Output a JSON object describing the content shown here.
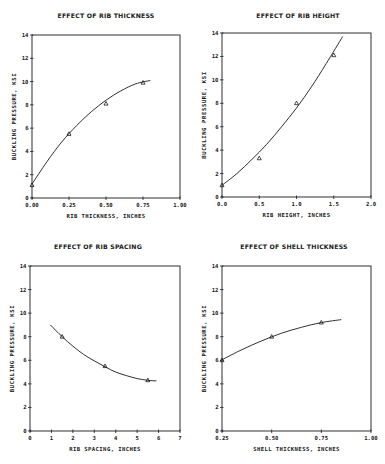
{
  "chart_data": [
    {
      "type": "line",
      "title": "EFFECT OF RIB THICKNESS",
      "xlabel": "RIB THICKNESS, INCHES",
      "ylabel": "BUCKLING PRESSURE, KSI",
      "xlim": [
        0,
        1.0
      ],
      "ylim": [
        0,
        14
      ],
      "xticks": [
        0,
        0.25,
        0.5,
        0.75,
        1.0
      ],
      "xtick_labels": [
        "0.00",
        "0.25",
        "0.50",
        "0.75",
        "1.00"
      ],
      "yticks": [
        0,
        2,
        4,
        6,
        8,
        10,
        12,
        14
      ],
      "ytick_labels": [
        "0",
        "2",
        "4",
        "6",
        "8",
        "10",
        "12",
        "14"
      ],
      "grid": false,
      "marker": "triangle",
      "points": {
        "x": [
          0.0,
          0.25,
          0.5,
          0.75
        ],
        "y": [
          1.1,
          5.5,
          8.1,
          9.9
        ]
      },
      "curve": {
        "x": [
          0.0,
          0.1,
          0.2,
          0.3,
          0.4,
          0.5,
          0.6,
          0.7,
          0.8
        ],
        "y": [
          1.2,
          3.1,
          4.8,
          6.2,
          7.4,
          8.4,
          9.2,
          9.8,
          10.1
        ]
      }
    },
    {
      "type": "line",
      "title": "EFFECT OF RIB HEIGHT",
      "xlabel": "RIB HEIGHT, INCHES",
      "ylabel": "BUCKLING PRESSURE, KSI",
      "xlim": [
        0,
        2.0
      ],
      "ylim": [
        0,
        14
      ],
      "xticks": [
        0,
        0.5,
        1.0,
        1.5,
        2.0
      ],
      "xtick_labels": [
        "0.0",
        "0.5",
        "1.0",
        "1.5",
        "2.0"
      ],
      "yticks": [
        0,
        2,
        4,
        6,
        8,
        10,
        12,
        14
      ],
      "ytick_labels": [
        "0",
        "2",
        "4",
        "6",
        "8",
        "10",
        "12",
        "14"
      ],
      "grid": false,
      "marker": "triangle",
      "points": {
        "x": [
          0.0,
          0.5,
          1.0,
          1.5
        ],
        "y": [
          1.0,
          3.3,
          8.0,
          12.1
        ]
      },
      "curve": {
        "x": [
          0.0,
          0.2,
          0.4,
          0.6,
          0.8,
          1.0,
          1.2,
          1.4,
          1.62
        ],
        "y": [
          1.0,
          2.0,
          3.2,
          4.5,
          6.0,
          7.6,
          9.4,
          11.4,
          13.7
        ]
      }
    },
    {
      "type": "line",
      "title": "EFFECT OF RIB SPACING",
      "xlabel": "RIB SPACING, INCHES",
      "ylabel": "BUCKLING PRESSURE, KSI",
      "xlim": [
        0,
        7
      ],
      "ylim": [
        0,
        14
      ],
      "xticks": [
        0,
        1,
        2,
        3,
        4,
        5,
        6,
        7
      ],
      "xtick_labels": [
        "0",
        "1",
        "2",
        "3",
        "4",
        "5",
        "6",
        "7"
      ],
      "yticks": [
        0,
        2,
        4,
        6,
        8,
        10,
        12,
        14
      ],
      "ytick_labels": [
        "0",
        "2",
        "4",
        "6",
        "8",
        "10",
        "12",
        "14"
      ],
      "grid": false,
      "marker": "triangle",
      "points": {
        "x": [
          1.5,
          3.5,
          5.5
        ],
        "y": [
          8.0,
          5.5,
          4.3
        ]
      },
      "curve": {
        "x": [
          0.95,
          1.5,
          2.0,
          2.5,
          3.0,
          3.5,
          4.0,
          4.5,
          5.0,
          5.5,
          5.9
        ],
        "y": [
          9.0,
          8.0,
          7.2,
          6.5,
          5.95,
          5.45,
          5.0,
          4.7,
          4.45,
          4.3,
          4.25
        ]
      }
    },
    {
      "type": "line",
      "title": "EFFECT OF SHELL THICKNESS",
      "xlabel": "SHELL THICKNESS, INCHES",
      "ylabel": "BUCKLING PRESSURE, KSI",
      "xlim": [
        0.25,
        1.0
      ],
      "ylim": [
        0,
        14
      ],
      "xticks": [
        0.25,
        0.5,
        0.75,
        1.0
      ],
      "xtick_labels": [
        "0.25",
        "0.50",
        "0.75",
        "1.00"
      ],
      "yticks": [
        0,
        2,
        4,
        6,
        8,
        10,
        12,
        14
      ],
      "ytick_labels": [
        "0",
        "2",
        "4",
        "6",
        "8",
        "10",
        "12",
        "14"
      ],
      "grid": false,
      "marker": "triangle",
      "points": {
        "x": [
          0.25,
          0.5,
          0.75
        ],
        "y": [
          6.0,
          8.0,
          9.2
        ]
      },
      "curve": {
        "x": [
          0.25,
          0.35,
          0.45,
          0.55,
          0.65,
          0.75,
          0.85
        ],
        "y": [
          6.05,
          6.9,
          7.65,
          8.3,
          8.8,
          9.2,
          9.45
        ]
      }
    }
  ],
  "layout": [
    {
      "left": 32,
      "top": 35,
      "right": 180,
      "bottom": 198,
      "title_x": 106,
      "title_y": 18
    },
    {
      "left": 222,
      "top": 33,
      "right": 371,
      "bottom": 197,
      "title_x": 298,
      "title_y": 18
    },
    {
      "left": 30,
      "top": 266,
      "right": 180,
      "bottom": 431,
      "title_x": 98,
      "title_y": 249
    },
    {
      "left": 222,
      "top": 266,
      "right": 371,
      "bottom": 431,
      "title_x": 294,
      "title_y": 249
    }
  ],
  "colors": {
    "ink": "#1a1a1a",
    "background": "#ffffff"
  }
}
